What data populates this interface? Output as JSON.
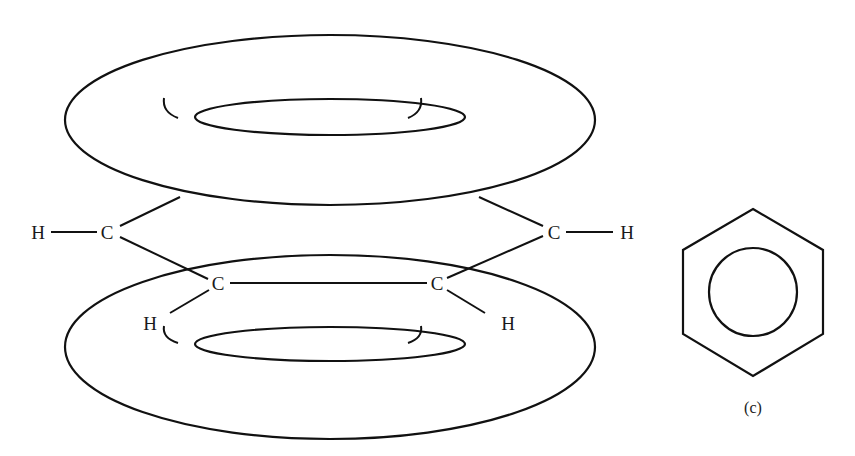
{
  "figure": {
    "colors": {
      "background": "#ffffff",
      "cloud_fill": "#d8d8d8",
      "cloud_edge": "#f4f4f4",
      "line": "#111111"
    },
    "atoms": [
      {
        "id": "h_left_top",
        "label": "H",
        "x": 38,
        "y": 232
      },
      {
        "id": "c_left_top",
        "label": "C",
        "x": 107,
        "y": 232
      },
      {
        "id": "c_left_bottom",
        "label": "C",
        "x": 218,
        "y": 283
      },
      {
        "id": "c_right_bottom",
        "label": "C",
        "x": 437,
        "y": 283
      },
      {
        "id": "h_left_bottom",
        "label": "H",
        "x": 150,
        "y": 323
      },
      {
        "id": "h_right_bottom",
        "label": "H",
        "x": 508,
        "y": 323
      },
      {
        "id": "c_right_top",
        "label": "C",
        "x": 554,
        "y": 232
      },
      {
        "id": "h_right_top",
        "label": "H",
        "x": 627,
        "y": 232
      }
    ],
    "upper_cloud": {
      "label": "pi-electron cloud (upper)"
    },
    "lower_cloud": {
      "label": "pi-electron cloud (lower)"
    },
    "ring_symbol": {
      "caption": "(c)"
    }
  }
}
